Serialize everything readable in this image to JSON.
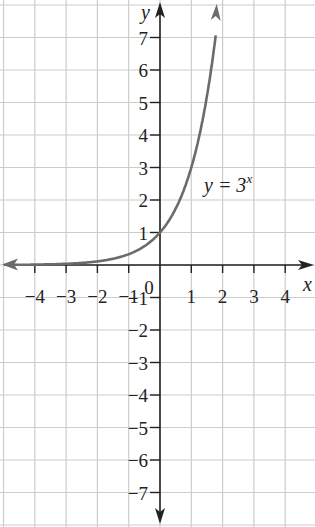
{
  "chart_data": {
    "type": "line",
    "title": "",
    "xlabel": "x",
    "ylabel": "y",
    "xlim": [
      -5,
      5
    ],
    "ylim": [
      -8,
      8
    ],
    "grid": true,
    "x_ticks": [
      "-4",
      "-3",
      "-2",
      "-1",
      "0",
      "1",
      "2",
      "3",
      "4"
    ],
    "y_ticks": [
      "7",
      "6",
      "5",
      "4",
      "3",
      "2",
      "1",
      "-1",
      "-2",
      "-3",
      "-4",
      "-5",
      "-6",
      "-7"
    ],
    "origin_label": "0",
    "series": [
      {
        "name": "y = 3^x",
        "label_base": "y = 3",
        "label_exp": "x",
        "x": [
          -5,
          -4,
          -3,
          -2,
          -1,
          -0.5,
          0,
          0.5,
          1,
          1.5,
          1.77
        ],
        "values": [
          0.004,
          0.012,
          0.037,
          0.111,
          0.333,
          0.577,
          1,
          1.732,
          3,
          5.196,
          7
        ]
      }
    ],
    "colors": {
      "grid": "#cccccc",
      "axis": "#222222",
      "curve": "#6b6b6b"
    }
  }
}
